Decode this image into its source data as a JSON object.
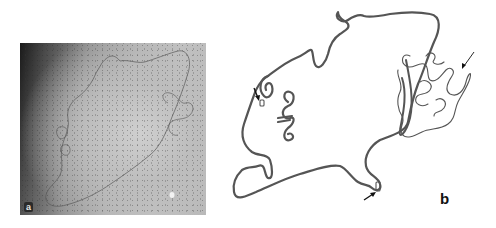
{
  "figure": {
    "panels": [
      {
        "id": "a",
        "label": "a",
        "kind": "electron-micrograph",
        "description": "Grayscale electron micrograph of a spread DNA molecule loop"
      },
      {
        "id": "b",
        "label": "b",
        "kind": "tracing",
        "description": "Line tracing of the molecule in panel a",
        "arrows": [
          {
            "position": "left loop",
            "direction": "down"
          },
          {
            "position": "bottom tail",
            "direction": "up-right"
          },
          {
            "position": "right tangle",
            "direction": "down-left"
          }
        ]
      }
    ],
    "colors": {
      "background": "#ffffff",
      "tracing_stroke": "#555555",
      "label_text": "#111111"
    }
  }
}
